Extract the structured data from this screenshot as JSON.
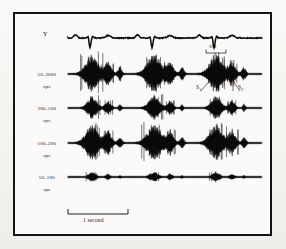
{
  "figure": {
    "kind": "phonocardiogram-with-ecg",
    "background_color": "#f7f6f3",
    "frame_color": "#131313",
    "trace_color": "#0a0a0a",
    "frame": {
      "x": 13,
      "y": 12,
      "width": 259,
      "height": 224
    }
  },
  "rows": [
    {
      "id": "ecg",
      "label_line1": "Y",
      "label_line2": "",
      "baseline_y": 38,
      "label_x": 46,
      "label_y": 35
    },
    {
      "id": "band-50-2000",
      "label_line1": "50–2000",
      "label_line2": "cps",
      "baseline_y": 74,
      "label_x": 44,
      "label_y": 71
    },
    {
      "id": "band-200-500",
      "label_line1": "200–500",
      "label_line2": "cps",
      "baseline_y": 108,
      "label_x": 44,
      "label_y": 105
    },
    {
      "id": "band-100-200",
      "label_line1": "100–200",
      "label_line2": "cps",
      "baseline_y": 143,
      "label_x": 44,
      "label_y": 140
    },
    {
      "id": "band-50-100",
      "label_line1": "50–100",
      "label_line2": "cps",
      "baseline_y": 177,
      "label_x": 44,
      "label_y": 174
    }
  ],
  "annotations": {
    "sm": {
      "text": "SM",
      "x": 212,
      "y": 48
    },
    "s1": {
      "text": "S",
      "sub": "1",
      "x": 198,
      "y": 88
    },
    "s2": {
      "text": "S",
      "sub": "2",
      "x": 240,
      "y": 88
    }
  },
  "scalebar": {
    "label": "1 second",
    "x_start": 68,
    "x_end": 128,
    "y": 214,
    "label_x": 98,
    "label_y": 224
  },
  "chart_data": {
    "type": "line",
    "title": "",
    "xlabel": "",
    "ylabel": "",
    "x_range": [
      68,
      262
    ],
    "time_per_second_px": 60,
    "cycle_starts": [
      88,
      150,
      212
    ],
    "series": [
      {
        "name": "Y",
        "kind": "ecg",
        "baseline_y": 38,
        "amplitude": 8,
        "description": "Electrocardiogram lead Y, three cardiac cycles with QRS deflections"
      },
      {
        "name": "50–2000 cps",
        "kind": "noise-burst",
        "baseline_y": 74,
        "amplitude": 16,
        "bursts": [
          {
            "center": 92,
            "width": 13,
            "amp": 1.0
          },
          {
            "center": 108,
            "width": 7,
            "amp": 0.58
          },
          {
            "center": 120,
            "width": 4,
            "amp": 0.34
          },
          {
            "center": 154,
            "width": 14,
            "amp": 1.0
          },
          {
            "center": 170,
            "width": 7,
            "amp": 0.6
          },
          {
            "center": 182,
            "width": 4,
            "amp": 0.32
          },
          {
            "center": 216,
            "width": 13,
            "amp": 1.0
          },
          {
            "center": 232,
            "width": 7,
            "amp": 0.62
          },
          {
            "center": 244,
            "width": 4,
            "amp": 0.33
          }
        ]
      },
      {
        "name": "200–500 cps",
        "kind": "noise-burst",
        "baseline_y": 108,
        "amplitude": 11,
        "bursts": [
          {
            "center": 92,
            "width": 10,
            "amp": 0.82
          },
          {
            "center": 108,
            "width": 6,
            "amp": 0.5
          },
          {
            "center": 120,
            "width": 3,
            "amp": 0.26
          },
          {
            "center": 154,
            "width": 11,
            "amp": 0.86
          },
          {
            "center": 170,
            "width": 6,
            "amp": 0.52
          },
          {
            "center": 182,
            "width": 3,
            "amp": 0.24
          },
          {
            "center": 216,
            "width": 10,
            "amp": 0.84
          },
          {
            "center": 232,
            "width": 6,
            "amp": 0.54
          },
          {
            "center": 244,
            "width": 3,
            "amp": 0.26
          }
        ]
      },
      {
        "name": "100–200 cps",
        "kind": "noise-burst",
        "baseline_y": 143,
        "amplitude": 15,
        "bursts": [
          {
            "center": 92,
            "width": 13,
            "amp": 0.96
          },
          {
            "center": 108,
            "width": 7,
            "amp": 0.62
          },
          {
            "center": 120,
            "width": 4,
            "amp": 0.3
          },
          {
            "center": 154,
            "width": 14,
            "amp": 1.0
          },
          {
            "center": 170,
            "width": 7,
            "amp": 0.64
          },
          {
            "center": 182,
            "width": 4,
            "amp": 0.3
          },
          {
            "center": 216,
            "width": 13,
            "amp": 0.98
          },
          {
            "center": 232,
            "width": 7,
            "amp": 0.66
          },
          {
            "center": 244,
            "width": 4,
            "amp": 0.3
          }
        ]
      },
      {
        "name": "50–100 cps",
        "kind": "noise-burst",
        "baseline_y": 177,
        "amplitude": 7,
        "bursts": [
          {
            "center": 92,
            "width": 8,
            "amp": 0.52
          },
          {
            "center": 108,
            "width": 5,
            "amp": 0.34
          },
          {
            "center": 120,
            "width": 3,
            "amp": 0.18
          },
          {
            "center": 154,
            "width": 9,
            "amp": 0.58
          },
          {
            "center": 170,
            "width": 5,
            "amp": 0.36
          },
          {
            "center": 182,
            "width": 3,
            "amp": 0.18
          },
          {
            "center": 216,
            "width": 8,
            "amp": 0.54
          },
          {
            "center": 232,
            "width": 5,
            "amp": 0.34
          },
          {
            "center": 244,
            "width": 3,
            "amp": 0.18
          }
        ]
      }
    ]
  }
}
